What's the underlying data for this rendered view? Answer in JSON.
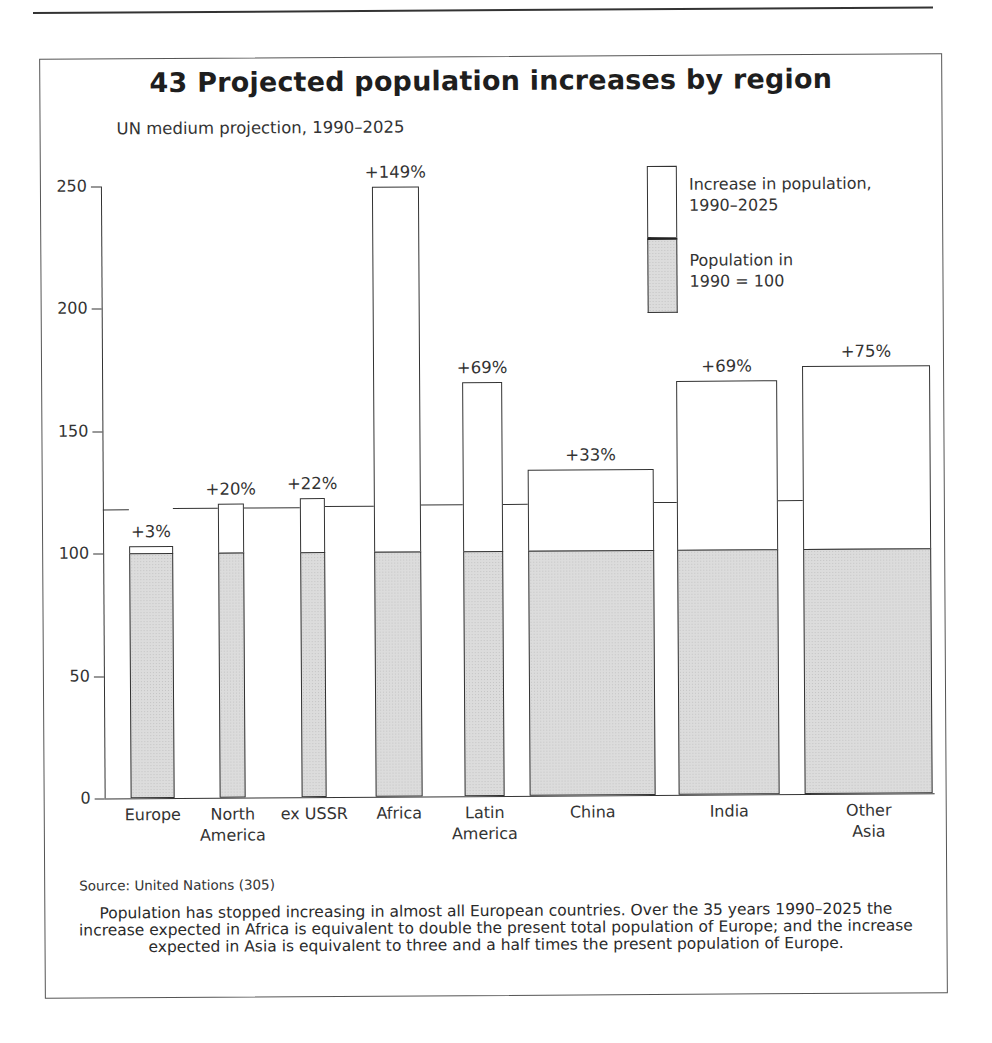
{
  "figure": {
    "title": "43 Projected population increases by region",
    "subtitle": "UN medium projection, 1990–2025",
    "source": "Source: United Nations (305)",
    "caption": "Population has stopped increasing in almost all European countries. Over the 35 years 1990–2025 the increase expected in Africa is equivalent to double the present total population of Europe; and the increase expected in Asia is equivalent to three and a half times the present population of Europe."
  },
  "legend": {
    "increase_label_line1": "Increase in population,",
    "increase_label_line2": "1990–2025",
    "base_label_line1": "Population in",
    "base_label_line2": "1990 = 100"
  },
  "y_ticks": [
    "0",
    "50",
    "100",
    "150",
    "200",
    "250"
  ],
  "colors": {
    "increase_fill": "#ffffff",
    "base_fill": "#dcdcdc",
    "outline": "#333333"
  },
  "chart_data": {
    "type": "bar",
    "title": "43 Projected population increases by region",
    "subtitle": "UN medium projection, 1990–2025",
    "xlabel": "",
    "ylabel": "",
    "ylim": [
      0,
      250
    ],
    "yticks": [
      0,
      50,
      100,
      150,
      200,
      250
    ],
    "grid": false,
    "stacked": true,
    "legend_position": "top-right",
    "categories": [
      "Europe",
      "North America",
      "ex USSR",
      "Africa",
      "Latin America",
      "China",
      "India",
      "Other Asia"
    ],
    "category_labels": [
      [
        "Europe"
      ],
      [
        "North",
        "America"
      ],
      [
        "ex USSR"
      ],
      [
        "Africa"
      ],
      [
        "Latin",
        "America"
      ],
      [
        "China"
      ],
      [
        "India"
      ],
      [
        "Other",
        "Asia"
      ]
    ],
    "series": [
      {
        "name": "Population in 1990 = 100",
        "values": [
          100,
          100,
          100,
          100,
          100,
          100,
          100,
          100
        ]
      },
      {
        "name": "Increase in population, 1990–2025",
        "values": [
          3,
          20,
          22,
          149,
          69,
          33,
          69,
          75
        ]
      }
    ],
    "totals": [
      103,
      120,
      122,
      249,
      169,
      133,
      169,
      175
    ],
    "annotations": [
      "+3%",
      "+20%",
      "+22%",
      "+149%",
      "+69%",
      "+33%",
      "+69%",
      "+75%"
    ],
    "reference_line": {
      "description": "unlabeled horizontal line across chart",
      "approx_value": 118
    }
  }
}
